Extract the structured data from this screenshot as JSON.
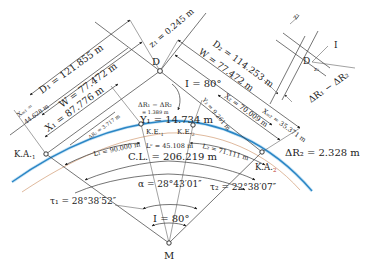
{
  "diagram": {
    "type": "clothoid-curve-geometry",
    "points": {
      "D": "D",
      "M": "M",
      "KA1": "K.A.",
      "KA1_sub": "1",
      "KA2": "K.A.",
      "KA2_sub": "2",
      "KE1": "K.E.",
      "KE1_sub": "1",
      "KE2": "K.E.",
      "KE2_sub": "2"
    },
    "dimensions": {
      "D1": "D₁ = 121.855 m",
      "W_left": "W = 77.472 m",
      "X1": "X₁ = 87.776 m",
      "XM1_a": "Xₘ₁ =",
      "XM1_b": "44.628 m",
      "z1": "z₁ = 0.245 m",
      "D2": "D₂ = 114.253 m",
      "W_right": "W = 77.472 m",
      "X2": "X₂ = 70.009 m",
      "XM2": "Xₘ₂ = 35.371 m",
      "Y2": "Y₂ = 9.261 m",
      "Y1": "Y₁ = 14.734 m",
      "dR_diff": "ΔR₁ − ΔR₂",
      "dR_diff_val": "= 1.389 m",
      "dR1": "ΔR₁ = 3.717 m",
      "dR2": "ΔR₂ = 2.328 m",
      "L1": "L₁ = 90.000 m",
      "Lc": "Lᶜ = 45.108 m",
      "L2": "L₂ = 71.111 m",
      "CL": "C.L. = 206.219 m",
      "I_top": "I = 80°",
      "alpha": "α = 28°43′01″",
      "tau1": "τ₁ = 28°38′52″",
      "tau2": "τ₂ = 22°38′07″",
      "I_bottom": "I = 80°"
    },
    "inset": {
      "z1": "z₁",
      "z2": "z₂",
      "D": "D",
      "I": "I",
      "dR_diff": "ΔR₁ − ΔR₂"
    },
    "colors": {
      "curve": "#2b86c5",
      "curve_glow": "#9fd0ef",
      "offset_line": "#c98a5a",
      "lines": "#3a3a3a"
    }
  }
}
